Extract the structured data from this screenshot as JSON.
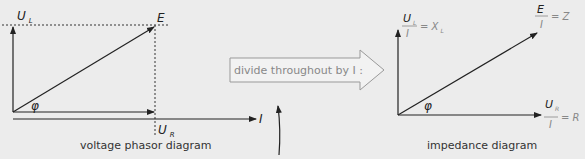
{
  "left_diagram": {
    "caption": "voltage phasor diagram",
    "labels": {
      "ul": "U",
      "ul_sub": "L",
      "e": "E",
      "ur": "U",
      "ur_sub": "R",
      "i": "I",
      "phi": "φ"
    }
  },
  "middle": {
    "arrow_text": "divide throughout by I :"
  },
  "right_diagram": {
    "caption": "impedance diagram",
    "labels": {
      "xl_num": "U",
      "xl_num_sub": "L",
      "xl_den": "I",
      "xl_eq": "= X",
      "xl_eq_sub": "L",
      "z_num": "E",
      "z_den": "I",
      "z_eq": "= Z",
      "r_num": "U",
      "r_num_sub": "R",
      "r_den": "I",
      "r_eq": "= R",
      "phi": "φ"
    }
  },
  "colors": {
    "background": "#ececec",
    "line": "#222222",
    "gray_text": "#888888"
  }
}
